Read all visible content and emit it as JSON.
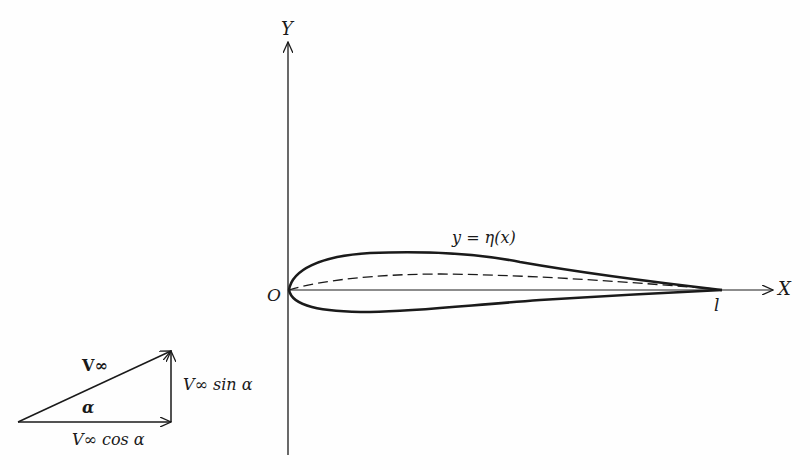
{
  "diagram": {
    "axes": {
      "y_label": "Y",
      "x_label": "X",
      "origin_label": "O",
      "chord_end_label": "l"
    },
    "airfoil": {
      "surface_label": "y = η(x)"
    },
    "velocity_triangle": {
      "hypotenuse_label": "V∞",
      "angle_label": "α",
      "vertical_label": "V∞ sin α",
      "horizontal_label": "V∞ cos α"
    },
    "colors": {
      "ink": "#1a1a1a",
      "background": "#fefefe"
    }
  }
}
